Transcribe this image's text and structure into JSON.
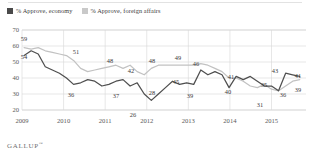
{
  "legend": {
    "position": "top-left",
    "items": [
      {
        "label": "% Approve, economy",
        "color": "#4a4a4a",
        "key": "economy"
      },
      {
        "label": "% Approve, foreign affairs",
        "color": "#c9c9c9",
        "key": "foreign_affairs"
      }
    ]
  },
  "footer": {
    "brand": "GALLUP",
    "trademark": "™"
  },
  "chart_data": {
    "type": "line",
    "title": "",
    "subtitle": "",
    "xlabel": "",
    "ylabel": "",
    "ylim": [
      20,
      70
    ],
    "yticks": [
      20,
      30,
      40,
      50,
      60,
      70
    ],
    "ytick_labels": [
      "20",
      "30",
      "40",
      "50",
      "60",
      "70"
    ],
    "xticks": [
      2009,
      2010,
      2011,
      2012,
      2013,
      2014,
      2015
    ],
    "xtick_labels": [
      "2009",
      "2010",
      "2011",
      "2012",
      "2013",
      "2014",
      "2015"
    ],
    "grid": "both",
    "legend_position": "top-left",
    "x": [
      2009.05,
      2009.22,
      2009.39,
      2009.56,
      2009.73,
      2009.9,
      2010.07,
      2010.24,
      2010.41,
      2010.58,
      2010.75,
      2010.92,
      2011.09,
      2011.26,
      2011.43,
      2011.6,
      2011.77,
      2011.94,
      2012.11,
      2012.28,
      2012.45,
      2012.62,
      2012.79,
      2012.96,
      2013.13,
      2013.3,
      2013.47,
      2013.64,
      2013.81,
      2013.98,
      2014.15,
      2014.32,
      2014.49,
      2014.66,
      2014.83,
      2015.0,
      2015.17,
      2015.34,
      2015.51,
      2015.68
    ],
    "series": [
      {
        "name": "% Approve, economy",
        "color": "#4f4f4f",
        "values": [
          54,
          57,
          55,
          47,
          45,
          43,
          40,
          36,
          37,
          39,
          38,
          35,
          36,
          38,
          39,
          35,
          37,
          30,
          26,
          30,
          34,
          38,
          36,
          37,
          36,
          45,
          42,
          44,
          42,
          34,
          41,
          39,
          41,
          38,
          35,
          35,
          32,
          43,
          42,
          41
        ],
        "labeled_points": [
          {
            "x": 2009.05,
            "value": 54
          },
          {
            "x": 2010.24,
            "value": 36
          },
          {
            "x": 2011.6,
            "value": 37
          },
          {
            "x": 2012.11,
            "value": 26
          },
          {
            "x": 2012.45,
            "value": 28
          },
          {
            "x": 2013.3,
            "value": 45
          },
          {
            "x": 2013.64,
            "value": 39
          },
          {
            "x": 2014.15,
            "value": 41
          },
          {
            "x": 2014.49,
            "value": 40
          },
          {
            "x": 2015.0,
            "value": 35
          },
          {
            "x": 2014.83,
            "value": 31
          },
          {
            "x": 2015.34,
            "value": 43
          },
          {
            "x": 2015.68,
            "value": 41
          }
        ]
      },
      {
        "name": "% Approve, foreign affairs",
        "color": "#c2c2c2",
        "values": [
          59,
          58,
          59,
          57,
          56,
          55,
          54,
          51,
          46,
          44,
          45,
          46,
          47,
          48,
          46,
          48,
          44,
          42,
          46,
          48,
          48,
          48,
          48,
          48,
          48,
          49,
          48,
          46,
          44,
          40,
          40,
          38,
          35,
          34,
          36,
          33,
          32,
          35,
          38,
          39
        ],
        "labeled_points": [
          {
            "x": 2009.05,
            "value": 59
          },
          {
            "x": 2010.24,
            "value": 51
          },
          {
            "x": 2011.26,
            "value": 48
          },
          {
            "x": 2011.94,
            "value": 43
          },
          {
            "x": 2012.45,
            "value": 48
          },
          {
            "x": 2013.3,
            "value": 49
          },
          {
            "x": 2013.64,
            "value": 46
          },
          {
            "x": 2015.17,
            "value": 36
          },
          {
            "x": 2015.68,
            "value": 39
          }
        ]
      }
    ],
    "annotations": [
      {
        "text": "59",
        "x": 24,
        "y": 41
      },
      {
        "text": "54",
        "x": 24,
        "y": 59
      },
      {
        "text": "51",
        "x": 76,
        "y": 54
      },
      {
        "text": "36",
        "x": 71,
        "y": 97
      },
      {
        "text": "48",
        "x": 110,
        "y": 63
      },
      {
        "text": "42",
        "x": 131,
        "y": 73
      },
      {
        "text": "37",
        "x": 116,
        "y": 98
      },
      {
        "text": "26",
        "x": 133,
        "y": 117
      },
      {
        "text": "48",
        "x": 152,
        "y": 63
      },
      {
        "text": "28",
        "x": 152,
        "y": 95
      },
      {
        "text": "49",
        "x": 178,
        "y": 60
      },
      {
        "text": "45",
        "x": 176,
        "y": 84
      },
      {
        "text": "39",
        "x": 190,
        "y": 98
      },
      {
        "text": "46",
        "x": 196,
        "y": 66
      },
      {
        "text": "41",
        "x": 231,
        "y": 79
      },
      {
        "text": "40",
        "x": 228,
        "y": 94
      },
      {
        "text": "35",
        "x": 264,
        "y": 87
      },
      {
        "text": "31",
        "x": 260,
        "y": 107
      },
      {
        "text": "43",
        "x": 275,
        "y": 73
      },
      {
        "text": "36",
        "x": 283,
        "y": 97
      },
      {
        "text": "41",
        "x": 298,
        "y": 78
      },
      {
        "text": "39",
        "x": 298,
        "y": 92
      }
    ]
  }
}
